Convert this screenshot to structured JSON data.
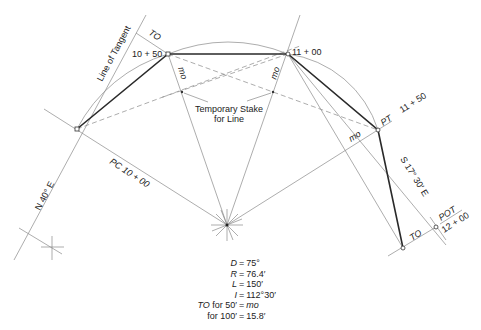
{
  "labels": {
    "line_of_tangent": "Line of Tangent",
    "to_top": "TO",
    "sta_1050": "10 + 50",
    "sta_1100": "11 + 00",
    "pt": "PT",
    "sta_1150": "11 + 50",
    "mo_left": "mo",
    "mo_right": "mo",
    "mo_pt": "mo",
    "temp_stake_line1": "Temporary Stake",
    "temp_stake_line2": "for Line",
    "bearing_in": "N 40° E",
    "pc": "PC 10 + 00",
    "bearing_out": "S 17° 30′ E",
    "to_bottom": "TO",
    "pot": "POT",
    "sta_1200": "12 + 00"
  },
  "legend": [
    {
      "key": "D",
      "key_style": "italic",
      "value": "75°"
    },
    {
      "key": "R",
      "key_style": "italic",
      "value": "76.4′"
    },
    {
      "key": "L",
      "key_style": "italic",
      "value": "150′"
    },
    {
      "key": "I",
      "key_style": "italic",
      "value": "112°30′"
    },
    {
      "key": "TO",
      "key_suffix": " for 50′",
      "value": "mo",
      "value_style": "italic"
    },
    {
      "key": "",
      "key_suffix": "for 100′",
      "value": "15.8′"
    }
  ],
  "points": {
    "pc": [
      77,
      129
    ],
    "sta_1050": [
      168,
      54
    ],
    "sta_1100": [
      288,
      54
    ],
    "pt": [
      378,
      130
    ],
    "center": [
      227,
      225
    ],
    "to_end": [
      403,
      248
    ],
    "pot": [
      436,
      227
    ],
    "ref_cross": [
      52,
      247
    ],
    "temp_stake_left": [
      182,
      92
    ],
    "temp_stake_right": [
      273,
      92
    ]
  },
  "colors": {
    "line": "#8a8a8a",
    "chord": "#2a2a2a",
    "text": "#222222",
    "background": "#ffffff"
  }
}
